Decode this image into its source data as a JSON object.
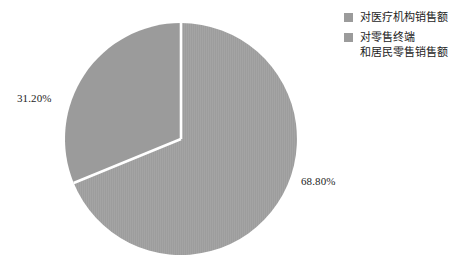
{
  "chart_data": {
    "type": "pie",
    "title": "",
    "subtitle": "",
    "xlabel": "",
    "ylabel": "",
    "grid": false,
    "legend_position": "top-right",
    "start_angle_deg": 0,
    "direction": "clockwise",
    "categories": [
      "对医疗机构销售额",
      "对零售终端\n和居民零售销售额"
    ],
    "values": [
      68.8,
      31.2
    ],
    "value_labels": [
      "68.80%",
      "31.20%"
    ],
    "colors": [
      "#9d9d9d",
      "#9b9b9b"
    ],
    "slices": [
      {
        "label": "对医疗机构销售额",
        "value": 68.8,
        "value_label": "68.80%",
        "color": "#9d9d9d",
        "start_deg": 0,
        "sweep_deg": 247.68
      },
      {
        "label": "对零售终端\n和居民零售销售额",
        "value": 31.2,
        "value_label": "31.20%",
        "color": "#9b9b9b",
        "start_deg": 247.68,
        "sweep_deg": 112.32
      }
    ]
  },
  "legend": {
    "items": [
      {
        "label": "对医疗机构销售额",
        "color": "#9b9b9b"
      },
      {
        "label": "对零售终端\n和居民零售销售额",
        "color": "#9b9b9b"
      }
    ]
  },
  "labels": {
    "left": "31.20%",
    "right": "68.80%"
  },
  "colors": {
    "background": "#ffffff",
    "slice_major": "#9d9d9d",
    "slice_minor": "#9b9b9b",
    "separator": "#ffffff",
    "text": "#1d1d1d"
  }
}
